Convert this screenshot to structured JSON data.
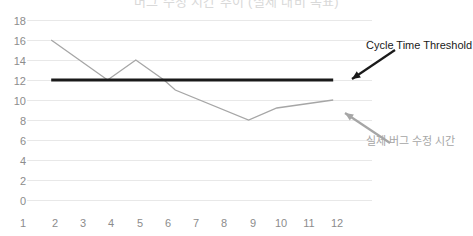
{
  "chart_data": {
    "type": "line",
    "title": "버그 수정 시간 추이 (실제 대비 목표)",
    "xlabel": "",
    "ylabel": "",
    "x": [
      1,
      2,
      3,
      4,
      5,
      6,
      7,
      8,
      9,
      10,
      11,
      12
    ],
    "xticklabels": [
      "1",
      "2",
      "3",
      "4",
      "5",
      "6",
      "7",
      "8",
      "9",
      "10",
      "11",
      "12"
    ],
    "yticklabels": [
      "0",
      "2",
      "4",
      "6",
      "8",
      "10",
      "12",
      "14",
      "16",
      "18"
    ],
    "yticks": [
      0,
      2,
      4,
      6,
      8,
      10,
      12,
      14,
      16,
      18
    ],
    "ylim": [
      0,
      18
    ],
    "xlim": [
      1,
      12
    ],
    "grid": "horizontal",
    "legend": "none",
    "series": [
      {
        "name": "실제 버그 수정 시간",
        "color": "#a6a6a6",
        "x": [
          2,
          4,
          5,
          6,
          6.4,
          9,
          10,
          12
        ],
        "values": [
          16,
          12,
          14,
          12,
          11,
          8,
          9.2,
          10
        ]
      },
      {
        "name": "Cycle Time Threshold",
        "color": "#1a1a1a",
        "x": [
          2,
          12
        ],
        "values": [
          12,
          12
        ]
      }
    ],
    "annotations": [
      {
        "name": "threshold-annotation",
        "text": "Cycle Time Threshold",
        "color": "#1a1a1a",
        "target_x": 12,
        "target_y": 12
      },
      {
        "name": "series-annotation",
        "text": "실제 버그 수정 시간",
        "color": "#a6a6a6",
        "target_x": 11.6,
        "target_y": 9.8
      }
    ],
    "colors": {
      "gridline": "#e8e8e8",
      "axis_text": "#8c8c8c",
      "series_actual": "#a6a6a6",
      "threshold": "#1a1a1a",
      "background": "#ffffff"
    }
  }
}
